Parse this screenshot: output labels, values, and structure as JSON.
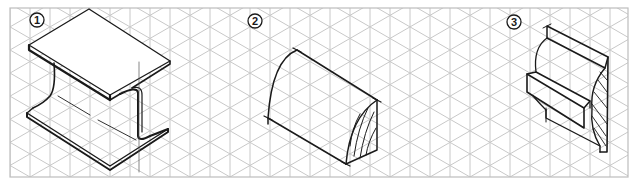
{
  "figure": {
    "grid": {
      "type": "isometric",
      "frame": {
        "x": 10,
        "y": 8,
        "width": 618,
        "height": 169
      },
      "spacing": 20,
      "line_color": "#c8c8c8",
      "frame_color": "#bdbdbd"
    },
    "ink_color": "#1a1a1a",
    "panels": [
      {
        "label": "1",
        "subject": "I-beam (isometric)"
      },
      {
        "label": "2",
        "subject": "Half-round bar with hatched cross-section"
      },
      {
        "label": "3",
        "subject": "Molding profile with hatched cross-section"
      }
    ]
  }
}
